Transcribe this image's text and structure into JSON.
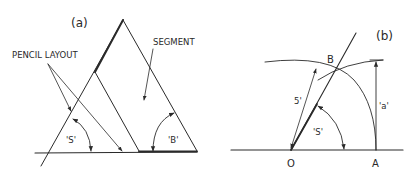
{
  "figure_a": {
    "label": "(a)",
    "pencil_layout_label": "PENCIL LAYOUT",
    "segment_label": "SEGMENT",
    "angle_s_label": "'S'",
    "angle_b_label": "'B'"
  },
  "figure_b": {
    "label": "(b)",
    "point_b": "B",
    "point_o": "O",
    "point_a": "A",
    "dim_5_label": "5'",
    "angle_s_label": "'S'",
    "dim_a_label": "'a'"
  },
  "colors": {
    "line": "#2a2a2a",
    "background": "#ffffff"
  }
}
